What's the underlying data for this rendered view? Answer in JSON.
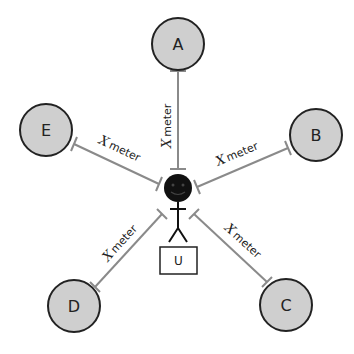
{
  "diagram": {
    "center": {
      "label": "U",
      "type": "user-stick-figure"
    },
    "nodes": [
      {
        "id": "A",
        "label": "A"
      },
      {
        "id": "B",
        "label": "B"
      },
      {
        "id": "C",
        "label": "C"
      },
      {
        "id": "D",
        "label": "D"
      },
      {
        "id": "E",
        "label": "E"
      }
    ],
    "edges": [
      {
        "from": "U",
        "to": "A",
        "symbol": "X",
        "unit": "meter"
      },
      {
        "from": "U",
        "to": "B",
        "symbol": "X",
        "unit": "meter"
      },
      {
        "from": "U",
        "to": "C",
        "symbol": "X",
        "unit": "meter"
      },
      {
        "from": "U",
        "to": "D",
        "symbol": "X",
        "unit": "meter"
      },
      {
        "from": "U",
        "to": "E",
        "symbol": "X",
        "unit": "meter"
      }
    ],
    "colors": {
      "node_fill": "#cfcfcf",
      "node_stroke": "#222222",
      "edge": "#8a8a8a",
      "user": "#111111"
    }
  }
}
